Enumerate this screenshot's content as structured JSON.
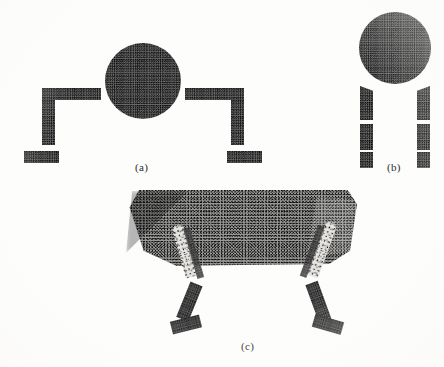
{
  "figure": {
    "caption_style": "lettered-subfigures",
    "background_color": "#fdfdfc",
    "ink_color": "#2b2b2b",
    "texture": "halftone-stipple-scan",
    "labels": {
      "a": "(a)",
      "b": "(b)",
      "c": "(c)"
    },
    "panels": [
      {
        "id": "a",
        "label": "(a)",
        "description": "circle with two stepped bracket arms",
        "parts": [
          {
            "name": "circle",
            "shape": "circle",
            "x": 105,
            "y": 43,
            "w": 76,
            "h": 76,
            "tone": "dense"
          },
          {
            "name": "left-horizontal-bar",
            "shape": "bar",
            "x": 42,
            "y": 88,
            "w": 59,
            "h": 12,
            "tone": "dense"
          },
          {
            "name": "left-vertical-bar",
            "shape": "bar",
            "x": 42,
            "y": 100,
            "w": 13,
            "h": 45,
            "tone": "dense"
          },
          {
            "name": "left-foot-bar",
            "shape": "bar",
            "x": 24,
            "y": 151,
            "w": 35,
            "h": 12,
            "tone": "dense"
          },
          {
            "name": "right-horizontal-bar",
            "shape": "bar",
            "x": 185,
            "y": 88,
            "w": 59,
            "h": 12,
            "tone": "dense"
          },
          {
            "name": "right-vertical-bar",
            "shape": "bar",
            "x": 231,
            "y": 100,
            "w": 13,
            "h": 45,
            "tone": "dense"
          },
          {
            "name": "right-foot-bar",
            "shape": "bar",
            "x": 227,
            "y": 151,
            "w": 35,
            "h": 12,
            "tone": "dense"
          }
        ]
      },
      {
        "id": "b",
        "label": "(b)",
        "description": "circle above two dashed vertical legs",
        "parts": [
          {
            "name": "circle",
            "shape": "circle",
            "x": 359,
            "y": 12,
            "w": 72,
            "h": 72,
            "tone": "dense"
          },
          {
            "name": "left-leg-segment-1",
            "shape": "bar",
            "x": 360,
            "y": 86,
            "w": 13,
            "h": 34,
            "tone": "dense"
          },
          {
            "name": "left-leg-segment-2",
            "shape": "bar",
            "x": 360,
            "y": 124,
            "w": 13,
            "h": 26,
            "tone": "dense"
          },
          {
            "name": "left-leg-segment-3",
            "shape": "bar",
            "x": 360,
            "y": 152,
            "w": 13,
            "h": 16,
            "tone": "dense"
          },
          {
            "name": "right-leg-segment-1",
            "shape": "bar",
            "x": 417,
            "y": 86,
            "w": 13,
            "h": 34,
            "tone": "dense"
          },
          {
            "name": "right-leg-segment-2",
            "shape": "bar",
            "x": 417,
            "y": 124,
            "w": 13,
            "h": 26,
            "tone": "dense"
          },
          {
            "name": "right-leg-segment-3",
            "shape": "bar",
            "x": 417,
            "y": 152,
            "w": 13,
            "h": 16,
            "tone": "dense"
          }
        ]
      },
      {
        "id": "c",
        "label": "(c)",
        "description": "quadruped: rounded trapezoidal body with four jointed legs",
        "parts": [
          {
            "name": "body",
            "shape": "rounded-trapezoid",
            "x": 125,
            "y": 190,
            "w": 232,
            "h": 78,
            "tone": "medium"
          },
          {
            "name": "front-upper-leg-highlight",
            "shape": "diagonal-bar",
            "tone": "vlight"
          },
          {
            "name": "rear-upper-leg-highlight",
            "shape": "diagonal-bar",
            "tone": "vlight"
          },
          {
            "name": "front-leg-lower",
            "shape": "diagonal-bar",
            "tone": "dense"
          },
          {
            "name": "front-foot",
            "shape": "diagonal-bar",
            "tone": "dense"
          },
          {
            "name": "rear-leg-lower",
            "shape": "diagonal-bar",
            "tone": "dense"
          },
          {
            "name": "rear-foot",
            "shape": "diagonal-bar",
            "tone": "dense"
          }
        ]
      }
    ]
  }
}
